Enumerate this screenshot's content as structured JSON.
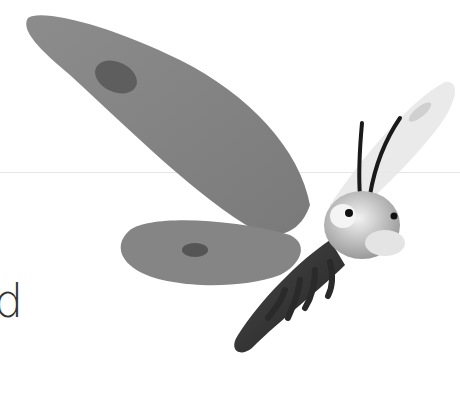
{
  "text": {
    "letter": "d"
  },
  "illustration": {
    "subject": "cartoon butterfly / moth character",
    "palette": {
      "wing": "#8a8a8a",
      "wing_spot": "#5f5f5f",
      "hind_wing_far": "#e6e6e6",
      "body": "#333333",
      "head": "#d2d2d2",
      "eye_pupil": "#111111",
      "rule": "#e6e6e6"
    }
  }
}
